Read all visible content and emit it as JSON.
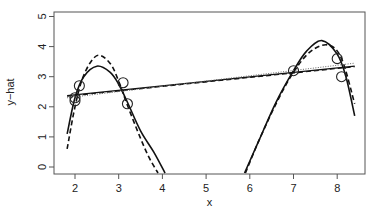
{
  "chart_data": {
    "type": "line",
    "title": "",
    "xlabel": "x",
    "ylabel": "y−hat",
    "xlim": [
      1.6,
      8.6
    ],
    "ylim": [
      -0.2,
      5.2
    ],
    "x_ticks": [
      2,
      3,
      4,
      5,
      6,
      7,
      8
    ],
    "y_ticks": [
      0,
      1,
      2,
      3,
      4,
      5
    ],
    "grid": false,
    "legend": null,
    "points": {
      "marker": "open-circle",
      "x": [
        2.0,
        2.0,
        2.1,
        3.1,
        3.2,
        7.0,
        8.0,
        8.1
      ],
      "y": [
        2.3,
        2.2,
        2.7,
        2.8,
        2.1,
        3.2,
        3.6,
        3.0
      ]
    },
    "series": [
      {
        "name": "poly-fit-solid",
        "style": "solid",
        "x": [
          1.82,
          2.0,
          2.2,
          2.5,
          2.8,
          3.0,
          3.2,
          3.5,
          3.8,
          4.06
        ],
        "y": [
          1.1,
          2.3,
          3.0,
          3.35,
          3.15,
          2.75,
          2.15,
          1.2,
          0.5,
          -0.2
        ]
      },
      {
        "name": "poly-fit-solid-right",
        "style": "solid",
        "x": [
          5.88,
          6.2,
          6.6,
          7.0,
          7.3,
          7.65,
          8.0,
          8.2,
          8.4
        ],
        "y": [
          -0.2,
          0.85,
          2.15,
          3.2,
          3.85,
          4.2,
          3.75,
          3.0,
          1.7
        ]
      },
      {
        "name": "poly-fit-dashed",
        "style": "dashed",
        "x": [
          1.82,
          2.0,
          2.2,
          2.5,
          2.8,
          3.0,
          3.2,
          3.5,
          3.7,
          3.9
        ],
        "y": [
          0.6,
          2.0,
          3.05,
          3.7,
          3.45,
          2.85,
          2.05,
          0.95,
          0.3,
          -0.2
        ]
      },
      {
        "name": "poly-fit-dashed-right",
        "style": "dashed",
        "x": [
          5.9,
          6.2,
          6.6,
          7.0,
          7.4,
          7.8,
          8.1,
          8.4
        ],
        "y": [
          -0.2,
          0.85,
          2.1,
          3.15,
          3.85,
          4.05,
          3.6,
          2.1
        ]
      },
      {
        "name": "linear-fit-solid",
        "style": "solid",
        "x": [
          1.82,
          8.4
        ],
        "y": [
          2.37,
          3.35
        ]
      },
      {
        "name": "linear-fit-dashed",
        "style": "dashed",
        "x": [
          1.82,
          8.4
        ],
        "y": [
          2.35,
          3.33
        ]
      },
      {
        "name": "linear-fit-dotted",
        "style": "dotted",
        "x": [
          1.82,
          8.4
        ],
        "y": [
          2.3,
          3.45
        ]
      }
    ]
  }
}
